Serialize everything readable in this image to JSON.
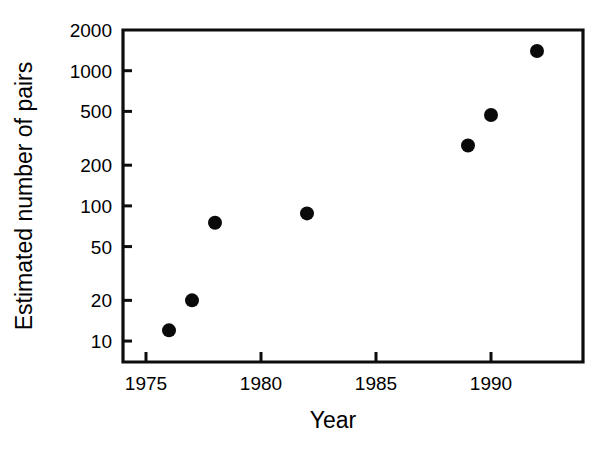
{
  "chart_data": {
    "type": "scatter",
    "title": "",
    "xlabel": "Year",
    "ylabel": "Estimated number of pairs",
    "yscale": "log",
    "xscale": "linear",
    "xlim": [
      1974.0,
      1994.0
    ],
    "ylim": [
      7,
      2000
    ],
    "grid": false,
    "legend": null,
    "xticks": [
      1975,
      1980,
      1985,
      1990
    ],
    "xticklabels": [
      "1975",
      "1980",
      "1985",
      "1990"
    ],
    "yticks": [
      10,
      20,
      50,
      100,
      200,
      500,
      1000,
      2000
    ],
    "yticklabels": [
      "10",
      "20",
      "50",
      "100",
      "200",
      "500",
      "1000",
      "2000"
    ],
    "x": [
      1976,
      1977,
      1978,
      1982,
      1989,
      1990,
      1992
    ],
    "values": [
      12,
      20,
      75,
      88,
      280,
      470,
      1400
    ],
    "points": [
      {
        "x": 1976,
        "y": 12
      },
      {
        "x": 1977,
        "y": 20
      },
      {
        "x": 1978,
        "y": 75
      },
      {
        "x": 1982,
        "y": 88
      },
      {
        "x": 1989,
        "y": 280
      },
      {
        "x": 1990,
        "y": 470
      },
      {
        "x": 1992,
        "y": 1400
      }
    ],
    "marker": {
      "shape": "circle",
      "color": "#0a0a0a",
      "size_px": 14
    }
  },
  "figure": {
    "background": "#ffffff",
    "axis_color": "#0d0d0d"
  }
}
